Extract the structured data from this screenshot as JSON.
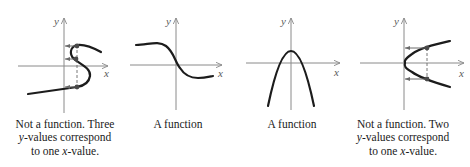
{
  "figure": {
    "panels": [
      {
        "id": "s-curve",
        "axis_labels": {
          "x": "x",
          "y": "y"
        },
        "caption": {
          "line1": "Not a function. Three",
          "line2_var": "y",
          "line2_rest": "-values correspond",
          "line3_pre": "to one ",
          "line3_var": "x",
          "line3_rest": "-value."
        },
        "is_function": false,
        "y_values_per_x": 3
      },
      {
        "id": "decreasing-sigmoid",
        "axis_labels": {
          "x": "x",
          "y": "y"
        },
        "caption": {
          "line1": "A function"
        },
        "is_function": true
      },
      {
        "id": "downward-parabola",
        "axis_labels": {
          "x": "x",
          "y": "y"
        },
        "caption": {
          "line1": "A function"
        },
        "is_function": true
      },
      {
        "id": "sideways-parabola",
        "axis_labels": {
          "x": "x",
          "y": "y"
        },
        "caption": {
          "line1": "Not a function. Two",
          "line2_var": "y",
          "line2_rest": "-values correspond",
          "line3_pre": "to one ",
          "line3_var": "x",
          "line3_rest": "-value."
        },
        "is_function": false,
        "y_values_per_x": 2
      }
    ],
    "colors": {
      "curve": "#1c1c1c",
      "axis": "#8a8a8a",
      "guides": "#6a6a6a",
      "text": "#1a1a1a"
    }
  }
}
